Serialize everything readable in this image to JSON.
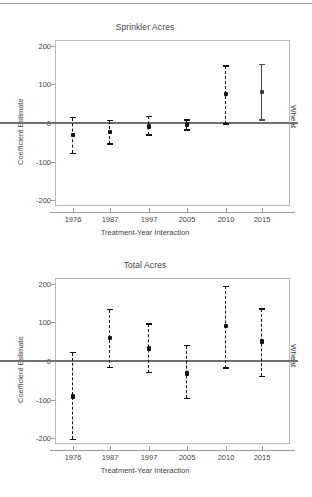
{
  "figure": {
    "side_label": "Wheat",
    "x_axis_title": "Treatment-Year Interaction",
    "y_axis_title": "Coefficient Estimate"
  },
  "chart_data": [
    {
      "type": "scatter",
      "title": "Sprinkler Acres",
      "xlabel": "Treatment-Year Interaction",
      "ylabel": "Coefficient Estimate",
      "side_label": "Wheat",
      "categories": [
        "1976",
        "1987",
        "1997",
        "2005",
        "2010",
        "2015"
      ],
      "yticks": [
        "-200",
        "-100",
        "0",
        "100",
        "200"
      ],
      "ytick_values": [
        -200,
        -100,
        0,
        100,
        200
      ],
      "ylim": [
        -215,
        215
      ],
      "grid": false,
      "legend": "none",
      "zero_reference_line": 0,
      "series": [
        {
          "name": "Coefficient Estimate",
          "values": [
            -31,
            -24,
            -9,
            -4,
            75,
            81
          ],
          "ci_low": [
            -79,
            -55,
            -31,
            -18,
            -2,
            7
          ],
          "ci_high": [
            14,
            6,
            17,
            8,
            148,
            152
          ],
          "linestyle": [
            "dashed",
            "dashed",
            "dashed",
            "dashed",
            "dashed",
            "solid"
          ]
        }
      ]
    },
    {
      "type": "scatter",
      "title": "Total Acres",
      "xlabel": "Treatment-Year Interaction",
      "ylabel": "Coefficient Estimate",
      "side_label": "Wheat",
      "categories": [
        "1976",
        "1987",
        "1997",
        "2005",
        "2010",
        "2015"
      ],
      "yticks": [
        "-200",
        "-100",
        "0",
        "100",
        "200"
      ],
      "ytick_values": [
        -200,
        -100,
        0,
        100,
        200
      ],
      "ylim": [
        -215,
        215
      ],
      "grid": false,
      "legend": "none",
      "zero_reference_line": 0,
      "series": [
        {
          "name": "Coefficient Estimate",
          "values": [
            -92,
            60,
            32,
            -32,
            91,
            50
          ],
          "ci_low": [
            -203,
            -17,
            -30,
            -97,
            -18,
            -40
          ],
          "ci_high": [
            22,
            133,
            96,
            40,
            193,
            134
          ],
          "linestyle": [
            "dashed",
            "dashed",
            "dashed",
            "dashed",
            "dashed",
            "dashed"
          ]
        }
      ]
    }
  ]
}
